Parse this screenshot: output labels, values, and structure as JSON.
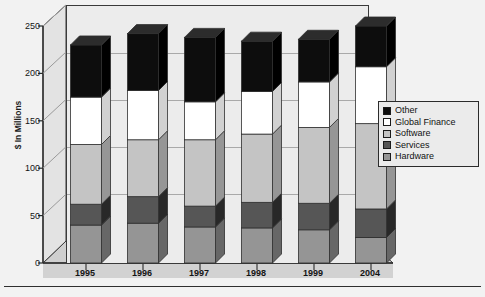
{
  "figure": {
    "clipped_caption": "",
    "y_axis_title": "$ In Millions"
  },
  "legend": {
    "position": "right",
    "items": [
      {
        "label": "Other",
        "color": "#0d0d0d"
      },
      {
        "label": "Global Finance",
        "color": "#ffffff"
      },
      {
        "label": "Software",
        "color": "#c4c4c4"
      },
      {
        "label": "Services",
        "color": "#565656"
      },
      {
        "label": "Hardware",
        "color": "#959595"
      }
    ]
  },
  "chart_data": {
    "type": "bar",
    "stacked": true,
    "title": "",
    "xlabel": "",
    "ylabel": "$ In Millions",
    "ylim": [
      0,
      250
    ],
    "yticks": [
      0,
      50,
      100,
      150,
      200,
      250
    ],
    "grid": true,
    "legend_position": "right",
    "categories": [
      "1995",
      "1996",
      "1997",
      "1998",
      "1999",
      "2004"
    ],
    "series": [
      {
        "name": "Hardware",
        "color": "#959595",
        "values": [
          40,
          42,
          38,
          37,
          35,
          27
        ]
      },
      {
        "name": "Services",
        "color": "#565656",
        "values": [
          22,
          28,
          22,
          27,
          28,
          30
        ]
      },
      {
        "name": "Software",
        "color": "#c4c4c4",
        "values": [
          63,
          60,
          70,
          72,
          80,
          90
        ]
      },
      {
        "name": "Global Finance",
        "color": "#ffffff",
        "values": [
          50,
          52,
          40,
          45,
          48,
          60
        ]
      },
      {
        "name": "Other",
        "color": "#0d0d0d",
        "values": [
          55,
          60,
          68,
          53,
          45,
          43
        ]
      }
    ],
    "totals": [
      230,
      242,
      238,
      234,
      236,
      250
    ]
  },
  "colors": {
    "panel_background": "#ececec",
    "page_background": "#f2f2f2",
    "gridline": "#a9a9a9",
    "axis": "#2f2f2f",
    "floor": "#cfcfcf",
    "wall": "#e2e2e2"
  }
}
